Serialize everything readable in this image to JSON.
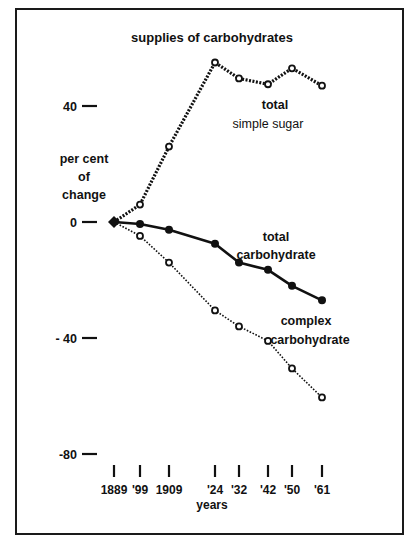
{
  "chart_data": {
    "type": "line",
    "title": "supplies of carbohydrates",
    "xlabel": "years",
    "ylabel": "per cent of change",
    "ylabel_lines": [
      "per cent",
      "of",
      "change"
    ],
    "x": [
      1889,
      1899,
      1909,
      1924,
      1932,
      1942,
      1950,
      1961
    ],
    "x_tick_labels": [
      "1889",
      "'99",
      "1909",
      "'24",
      "'32",
      "'42",
      "'50",
      "'61"
    ],
    "y_ticks": [
      40,
      0,
      -40,
      -80
    ],
    "y_tick_labels": [
      "40",
      "0",
      "- 40",
      "-80"
    ],
    "ylim": [
      -80,
      60
    ],
    "grid": false,
    "legend": "inline labels",
    "series": [
      {
        "name": "total simple sugar",
        "label_lines": [
          "total",
          "simple sugar"
        ],
        "style": "dotted-thick, open circles",
        "values": [
          0,
          6,
          26,
          55,
          49.5,
          47.5,
          53,
          47
        ]
      },
      {
        "name": "total carbohydrate",
        "label_lines": [
          "total",
          "carbohydrate"
        ],
        "style": "solid, filled circles",
        "values": [
          0,
          -0.7,
          -2.7,
          -7.5,
          -14,
          -16.5,
          -22,
          -27
        ]
      },
      {
        "name": "complex carbohydrate",
        "label_lines": [
          "complex",
          "carbohydrate"
        ],
        "style": "dotted-thin, open circles",
        "values": [
          0,
          -4.8,
          -14,
          -30.5,
          -36,
          -41,
          -50.5,
          -60.5
        ]
      }
    ]
  },
  "layout": {
    "x_px": [
      114,
      140,
      169,
      215,
      239,
      268,
      292,
      322
    ],
    "y_zero_px": 222,
    "px_per_unit": 2.9,
    "colors": {
      "ink": "#111111",
      "background": "#ffffff"
    }
  }
}
